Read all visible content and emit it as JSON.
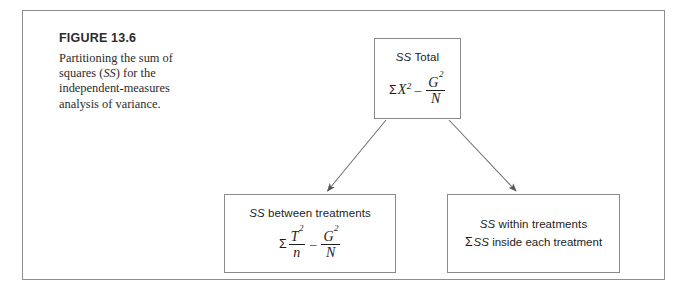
{
  "figure": {
    "number_label": "FIGURE 13.6",
    "caption_part1": "Partitioning the sum of squares (",
    "caption_italic": "SS",
    "caption_part2": ") for the independent-measures analysis of variance.",
    "frame_color": "#8e8e90",
    "box_border_color": "#8a8a8c",
    "text_color": "#1d1d1d",
    "background": "#ffffff"
  },
  "diagram": {
    "type": "flow-tree",
    "nodes": [
      {
        "id": "ss-total",
        "title_italic": "SS",
        "title_rest": " Total",
        "formula": {
          "sigma": "Σ",
          "term1_var": "X",
          "term1_sup": "2",
          "operator": "–",
          "frac_num_var": "G",
          "frac_num_sup": "2",
          "frac_den": "N"
        }
      },
      {
        "id": "ss-between",
        "title_italic": "SS",
        "title_rest": " between treatments",
        "formula": {
          "sigma": "Σ",
          "frac1_num_var": "T",
          "frac1_num_sup": "2",
          "frac1_den": "n",
          "operator": "–",
          "frac2_num_var": "G",
          "frac2_num_sup": "2",
          "frac2_den": "N"
        }
      },
      {
        "id": "ss-within",
        "title_italic": "SS",
        "title_rest": " within treatments",
        "line2_sigma": "Σ",
        "line2_italic": "SS",
        "line2_rest": " inside each treatment"
      }
    ],
    "edges": [
      {
        "id": "edge-total-to-between",
        "from": "ss-total",
        "to": "ss-between",
        "arrowhead": true
      },
      {
        "id": "edge-total-to-within",
        "from": "ss-total",
        "to": "ss-within",
        "arrowhead": true
      }
    ]
  }
}
